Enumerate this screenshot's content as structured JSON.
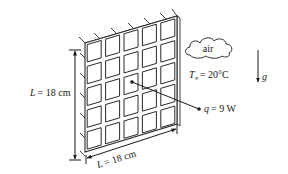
{
  "figure": {
    "panel": {
      "grid_rows": 5,
      "grid_cols": 5,
      "stroke_color": "#2a2a2a"
    },
    "labels": {
      "height_var": "L",
      "height_eq": "= 18 cm",
      "width_var": "L",
      "width_eq": "= 18 cm",
      "air": "air",
      "temp_var": "T",
      "temp_sub": "∞",
      "temp_eq": "= 20°C",
      "heat_var": "q",
      "heat_eq": "= 9 W",
      "gravity": "g"
    }
  }
}
